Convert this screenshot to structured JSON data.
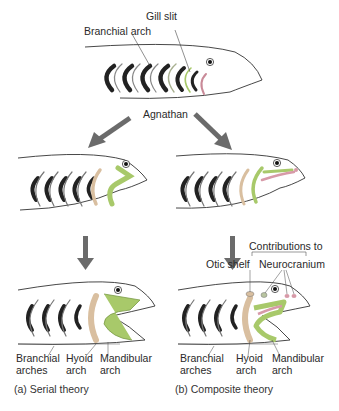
{
  "top": {
    "labels": {
      "branchial_arch": "Branchial arch",
      "gill_slit": "Gill slit",
      "agnathan": "Agnathan"
    }
  },
  "serial": {
    "labels": {
      "branchial_arches_1": "Branchial",
      "branchial_arches_2": "arches",
      "hyoid_1": "Hyoid",
      "hyoid_2": "arch",
      "mandibular_1": "Mandibular",
      "mandibular_2": "arch"
    },
    "caption": "(a) Serial theory"
  },
  "composite": {
    "labels": {
      "contributions_to": "Contributions to",
      "otic_shelf": "Otic shelf",
      "neurocranium": "Neurocranium",
      "branchial_arches_1": "Branchial",
      "branchial_arches_2": "arches",
      "hyoid_1": "Hyoid",
      "hyoid_2": "arch",
      "mandibular_1": "Mandibular",
      "mandibular_2": "arch"
    },
    "caption": "(b) Composite theory"
  },
  "colors": {
    "mandibular": "#a8c96a",
    "hyoid": "#d9bfa0",
    "neurocranium": "#d79aa8",
    "arrow": "#6b6b6b",
    "gill": "#111111"
  }
}
